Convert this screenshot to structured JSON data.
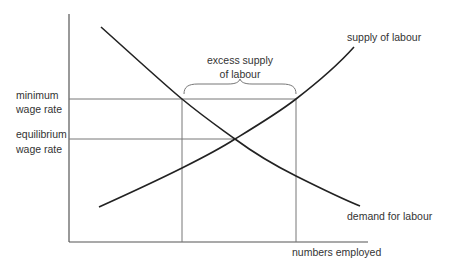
{
  "diagram": {
    "type": "economics-supply-demand",
    "y_axis_labels": {
      "minimum_wage": [
        "minimum",
        "wage rate"
      ],
      "equilibrium_wage": [
        "equilibrium",
        "wage rate"
      ]
    },
    "x_axis_label": "numbers employed",
    "curves": {
      "supply": {
        "label": "supply of labour"
      },
      "demand": {
        "label": "demand for labour"
      }
    },
    "annotation": {
      "brace_label": [
        "excess supply",
        "of labour"
      ]
    },
    "colors": {
      "axis": "#555555",
      "curve": "#222222",
      "guide": "#777777",
      "text": "#333333"
    }
  }
}
